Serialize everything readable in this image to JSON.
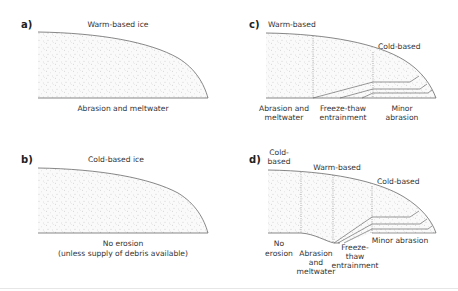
{
  "panels": {
    "a": {
      "label": "a)",
      "title": "Warm-based ice",
      "caption": "Abrasion and meltwater"
    },
    "b": {
      "label": "b)",
      "title": "Cold-based ice",
      "caption_line1": "No erosion",
      "caption_line2": "(unless supply of debris available)"
    },
    "c": {
      "label": "c)",
      "zone_warm": "Warm-based",
      "zone_cold": "Cold-based",
      "captions": {
        "abrasion_1": "Abrasion and",
        "abrasion_2": "meltwater",
        "freeze_1": "Freeze-thaw",
        "freeze_2": "entrainment",
        "minor_1": "Minor",
        "minor_2": "abrasion"
      }
    },
    "d": {
      "label": "d)",
      "zone_cold_1a": "Cold-",
      "zone_cold_1b": "based",
      "zone_warm": "Warm-based",
      "zone_cold_2": "Cold-based",
      "captions": {
        "no_erosion_1": "No",
        "no_erosion_2": "erosion",
        "abrasion_1": "Abrasion",
        "abrasion_2": "and",
        "abrasion_3": "meltwater",
        "freeze_1": "Freeze-",
        "freeze_2": "thaw",
        "freeze_3": "entrainment",
        "minor": "Minor abrasion"
      }
    }
  },
  "colors": {
    "line": "#555555",
    "stipple": "#b8b8b8",
    "text": "#333333"
  }
}
